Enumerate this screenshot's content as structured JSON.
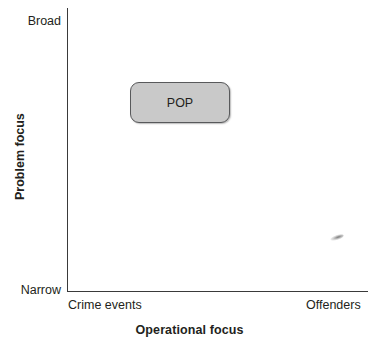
{
  "chart_data": {
    "type": "scatter",
    "title": "",
    "xlabel": "Operational focus",
    "ylabel": "Problem focus",
    "x_tick_labels": [
      "Crime events",
      "Offenders"
    ],
    "y_tick_labels": [
      "Narrow",
      "Broad"
    ],
    "xlim": [
      "Crime events",
      "Offenders"
    ],
    "ylim": [
      "Narrow",
      "Broad"
    ],
    "grid": false,
    "legend": "none",
    "items": [
      {
        "label": "POP",
        "operational_focus": 0.27,
        "problem_focus": 0.77,
        "shape": "rounded-rectangle",
        "fill": "#c9c9c9",
        "border": "#58595b"
      }
    ],
    "annotations": []
  },
  "axes": {
    "y": {
      "title": "Problem focus",
      "low_label": "Narrow",
      "high_label": "Broad"
    },
    "x": {
      "title": "Operational focus",
      "low_label": "Crime events",
      "high_label": "Offenders"
    }
  },
  "nodes": {
    "pop": {
      "label": "POP"
    }
  },
  "colors": {
    "background": "#ffffff",
    "axis_line": "#3a3a3a",
    "text": "#231f20",
    "node_fill": "#c9c9c9",
    "node_border": "#58595b"
  }
}
